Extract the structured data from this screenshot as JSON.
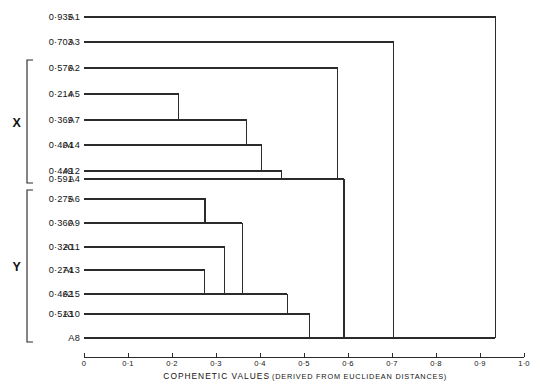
{
  "figure": {
    "title_partial": "",
    "axis_title_main": "COPHENETIC  VALUES",
    "axis_title_sub": "(DERIVED  FROM  EUCLIDEAN  DISTANCES)",
    "ink_color": "#2b2b2b",
    "background": "#ffffff"
  },
  "axis": {
    "min": 0,
    "max": 1.0,
    "tick_values": [
      0,
      0.1,
      0.2,
      0.3,
      0.4,
      0.5,
      0.6,
      0.7,
      0.8,
      0.9,
      1.0
    ],
    "tick_labels": [
      "0",
      "0·1",
      "0·2",
      "0·3",
      "0·4",
      "0·5",
      "0·6",
      "0·7",
      "0·8",
      "0·9",
      "1·0"
    ]
  },
  "groups": [
    {
      "label": "X",
      "members": [
        "A2",
        "A5",
        "A7",
        "A14",
        "A12",
        "A4"
      ]
    },
    {
      "label": "Y",
      "members": [
        "A6",
        "A9",
        "A11",
        "A13",
        "A15",
        "A10",
        "A8"
      ]
    }
  ],
  "leaves": [
    {
      "name": "A1",
      "value_label": "0·935",
      "value": 0.935
    },
    {
      "name": "A3",
      "value_label": "0·703",
      "value": 0.703
    },
    {
      "name": "A2",
      "value_label": "0·576",
      "value": 0.576
    },
    {
      "name": "A5",
      "value_label": "0·214",
      "value": 0.214
    },
    {
      "name": "A7",
      "value_label": "0·369",
      "value": 0.369
    },
    {
      "name": "A14",
      "value_label": "0·404",
      "value": 0.404
    },
    {
      "name": "A12",
      "value_label": "0·449",
      "value": 0.449
    },
    {
      "name": "A4",
      "value_label": "0·591",
      "value": 0.591
    },
    {
      "name": "A6",
      "value_label": "0·275",
      "value": 0.275
    },
    {
      "name": "A9",
      "value_label": "0·360",
      "value": 0.36
    },
    {
      "name": "A11",
      "value_label": "0·320",
      "value": 0.32
    },
    {
      "name": "A13",
      "value_label": "0·274",
      "value": 0.274
    },
    {
      "name": "A15",
      "value_label": "0·462",
      "value": 0.462
    },
    {
      "name": "A10",
      "value_label": "0·513",
      "value": 0.513
    },
    {
      "name": "A8",
      "value_label": "",
      "value": null
    }
  ],
  "chart_data": {
    "type": "line",
    "subtype": "dendrogram",
    "orientation": "horizontal",
    "title": "",
    "xlabel": "COPHENETIC VALUES (DERIVED FROM EUCLIDEAN DISTANCES)",
    "ylabel": "",
    "xlim": [
      0,
      1.0
    ],
    "grid": false,
    "legend": "none",
    "leaf_order": [
      "A1",
      "A3",
      "A2",
      "A5",
      "A7",
      "A14",
      "A12",
      "A4",
      "A6",
      "A9",
      "A11",
      "A13",
      "A15",
      "A10",
      "A8"
    ],
    "cophenetic_values": {
      "A1": 0.935,
      "A3": 0.703,
      "A2": 0.576,
      "A5": 0.214,
      "A7": 0.369,
      "A14": 0.404,
      "A12": 0.449,
      "A4": 0.591,
      "A6": 0.275,
      "A9": 0.36,
      "A11": 0.32,
      "A13": 0.274,
      "A15": 0.462,
      "A10": 0.513
    },
    "merges": [
      {
        "height": 0.214,
        "members": [
          "A5",
          "A7"
        ]
      },
      {
        "height": 0.369,
        "members": [
          "A5",
          "A7",
          "A14"
        ]
      },
      {
        "height": 0.404,
        "members": [
          "A5",
          "A7",
          "A14",
          "A12"
        ]
      },
      {
        "height": 0.449,
        "members": [
          "A5",
          "A7",
          "A14",
          "A12",
          "A4"
        ]
      },
      {
        "height": 0.576,
        "members": [
          "A2",
          "A5",
          "A7",
          "A14",
          "A12",
          "A4"
        ]
      },
      {
        "height": 0.275,
        "members": [
          "A6",
          "A9"
        ]
      },
      {
        "height": 0.274,
        "members": [
          "A13",
          "A15"
        ]
      },
      {
        "height": 0.32,
        "members": [
          "A11",
          "A13",
          "A15"
        ]
      },
      {
        "height": 0.36,
        "members": [
          "A6",
          "A9",
          "A11",
          "A13",
          "A15"
        ]
      },
      {
        "height": 0.513,
        "members": [
          "A6",
          "A9",
          "A11",
          "A13",
          "A15",
          "A10",
          "A8"
        ]
      },
      {
        "height": 0.591,
        "members": [
          "X-cluster",
          "Y-cluster"
        ]
      },
      {
        "height": 0.703,
        "members": [
          "A3",
          "XY-cluster"
        ]
      },
      {
        "height": 0.935,
        "members": [
          "A1",
          "A3-XY-cluster"
        ]
      }
    ],
    "clusters": {
      "X": [
        "A2",
        "A5",
        "A7",
        "A14",
        "A12",
        "A4"
      ],
      "Y": [
        "A6",
        "A9",
        "A11",
        "A13",
        "A15",
        "A10",
        "A8"
      ]
    }
  }
}
